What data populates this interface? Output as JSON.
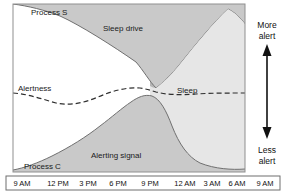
{
  "chart_data": {
    "type": "area",
    "xlabel": "",
    "ylabel": "",
    "grid": false,
    "legend_position": "inline-annotations",
    "x_tick_labels": [
      "9 AM",
      "12 PM",
      "3 PM",
      "6 PM",
      "9 PM",
      "12 AM",
      "3 AM",
      "6 AM",
      "9 AM"
    ],
    "x_tick_positions": [
      0,
      3,
      6,
      9,
      12,
      15,
      18,
      21,
      24
    ],
    "xlim": [
      0,
      24
    ],
    "ylim": [
      0,
      100
    ],
    "night_band": {
      "label": "Sleep",
      "start": "12 AM",
      "end": "7 AM"
    },
    "series": [
      {
        "name": "Process S",
        "display_label": "Sleep drive",
        "style": "filled-area-from-top",
        "color": "#c9c9c9",
        "x": [
          0,
          3,
          6,
          9,
          12,
          14.3,
          15,
          18,
          21,
          22.2,
          24
        ],
        "values": [
          92,
          84,
          76,
          68,
          60,
          55,
          58,
          72,
          88,
          96,
          90
        ]
      },
      {
        "name": "Process C",
        "display_label": "Alerting signal",
        "style": "filled-area-from-bottom",
        "color": "#c9c9c9",
        "x": [
          0,
          3,
          6,
          9,
          10.5,
          12,
          13.2,
          14.3,
          15,
          16.5,
          18,
          21,
          24
        ],
        "values": [
          3,
          7,
          14,
          26,
          32,
          42,
          50,
          52,
          47,
          30,
          17,
          8,
          6
        ]
      },
      {
        "name": "Alertness",
        "display_label": "Alertness",
        "style": "dashed-line",
        "color": "#333333",
        "x": [
          0,
          2,
          4,
          6,
          8,
          10,
          12,
          13.5,
          14.3,
          15,
          17,
          19,
          21,
          23,
          24
        ],
        "values": [
          50,
          49,
          46,
          43,
          44,
          48,
          52,
          54,
          55,
          52,
          51,
          51,
          51,
          51,
          51
        ]
      }
    ],
    "annotations": [
      {
        "name": "process-s",
        "text": "Process S"
      },
      {
        "name": "sleep-drive",
        "text": "Sleep drive"
      },
      {
        "name": "alertness",
        "text": "Alertness"
      },
      {
        "name": "sleep",
        "text": "Sleep"
      },
      {
        "name": "alerting-signal",
        "text": "Alerting signal"
      },
      {
        "name": "process-c",
        "text": "Process C"
      }
    ],
    "axis_arrow": {
      "top_line1": "More",
      "top_line2": "alert",
      "bottom_line1": "Less",
      "bottom_line2": "alert"
    },
    "colors": {
      "area_fill": "#c9c9c9",
      "night_band": "#b3b3b3",
      "sleep_region": "#e3e3e3",
      "curve_stroke": "#6b6b6b",
      "dashed_line": "#333333",
      "frame": "#8a8a8a",
      "background": "#ffffff",
      "text": "#1a1a1a"
    }
  },
  "labels": {
    "process_s": "Process S",
    "sleep_drive": "Sleep drive",
    "alertness": "Alertness",
    "sleep": "Sleep",
    "alerting_signal": "Alerting signal",
    "process_c": "Process C",
    "more": "More",
    "alert_top": "alert",
    "less": "Less",
    "alert_bottom": "alert"
  },
  "x_axis": {
    "ticks": [
      "9 AM",
      "12 PM",
      "3 PM",
      "6 PM",
      "9 PM",
      "12 AM",
      "3 AM",
      "6 AM",
      "9 AM"
    ]
  }
}
